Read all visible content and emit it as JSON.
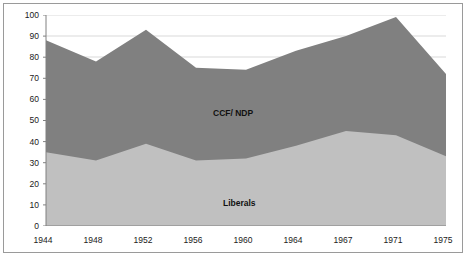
{
  "chart_data": {
    "type": "area",
    "stacked": true,
    "title": "",
    "subtitle": "",
    "xlabel": "",
    "ylabel": "",
    "categories": [
      "1944",
      "1948",
      "1952",
      "1956",
      "1960",
      "1964",
      "1967",
      "1971",
      "1975"
    ],
    "series": [
      {
        "name": "Liberals",
        "color": "#c0c0c0",
        "values": [
          35,
          31,
          39,
          31,
          32,
          38,
          45,
          43,
          33
        ]
      },
      {
        "name": "CCF/ NDP",
        "color": "#808080",
        "values": [
          53,
          47,
          54,
          44,
          42,
          45,
          45,
          56,
          39
        ]
      }
    ],
    "totals": [
      88,
      78,
      93,
      75,
      74,
      83,
      90,
      99,
      72
    ],
    "ylim": [
      0,
      100
    ],
    "yticks": [
      0,
      10,
      20,
      30,
      40,
      50,
      60,
      70,
      80,
      90,
      100
    ],
    "ytick_labels": [
      "0",
      "10",
      "20",
      "30",
      "40",
      "50",
      "60",
      "70",
      "80",
      "90",
      "100"
    ],
    "grid": true,
    "grid_color": "#d9d9d9",
    "legend_position": "inline-annotations",
    "annotations": [
      {
        "text": "CCF/ NDP",
        "x": "1960",
        "y": 58
      },
      {
        "text": "Liberals",
        "x": "1960",
        "y": 14
      }
    ],
    "axis_color": "#808080",
    "frame_color": "#9a9a9a",
    "background": "#ffffff"
  },
  "labels": {
    "series_ccf": "CCF/ NDP",
    "series_liberals": "Liberals"
  }
}
